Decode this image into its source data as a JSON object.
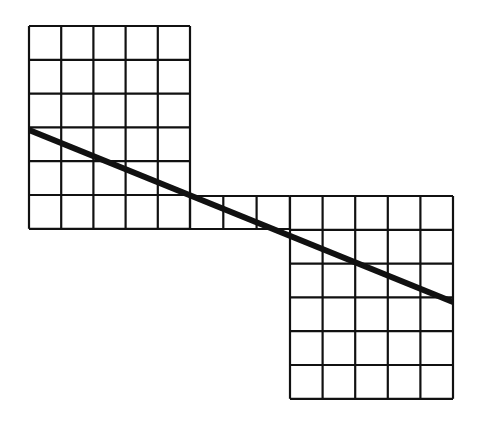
{
  "diagram": {
    "colors": {
      "background": "#ffffff",
      "grid_line": "#111111",
      "diagonal": "#111111"
    },
    "grids": [
      {
        "name": "left-grid",
        "x": 29,
        "y": 26,
        "cols": 5,
        "rows": 6,
        "cell_w": 32.2,
        "cell_h": 33.8
      },
      {
        "name": "connector-row",
        "x": 190,
        "y": 196,
        "cols": 3,
        "rows": 1,
        "cell_w": 33.3,
        "cell_h": 33
      },
      {
        "name": "right-grid",
        "x": 290,
        "y": 196,
        "cols": 5,
        "rows": 6,
        "cell_w": 32.6,
        "cell_h": 33.8
      }
    ],
    "diagonal": {
      "x1": 29,
      "y1": 130,
      "x2": 453,
      "y2": 302,
      "width": 6
    }
  }
}
